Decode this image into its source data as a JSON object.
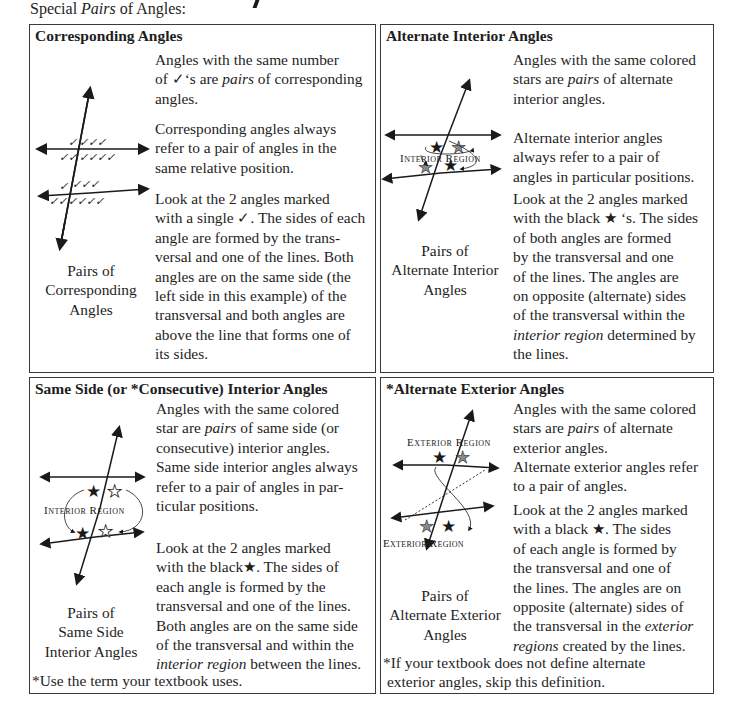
{
  "page": {
    "title_prefix": "Special ",
    "title_italic": "Pairs",
    "title_suffix": " of Angles:"
  },
  "cells": {
    "corresponding": {
      "title": "Corresponding Angles",
      "para1": [
        "Angles with the same number",
        "of ✓‘s are ",
        "pairs",
        " of corresponding",
        "angles."
      ],
      "para2": [
        "Corresponding angles always",
        "refer to a pair of angles in the",
        "same relative position."
      ],
      "para3": [
        "Look at the 2 angles marked",
        "with a single ✓. The sides of each",
        "angle are formed by the trans-",
        "versal and one of the lines. Both",
        "angles are on the same side (the",
        "left side in this example) of the",
        "transversal and both angles are",
        "above the line that forms one of",
        "its sides."
      ],
      "caption": [
        "Pairs of",
        "Corresponding",
        "Angles"
      ],
      "diagram_icon": "check-marks-diagram"
    },
    "alternate_interior": {
      "title": "Alternate Interior Angles",
      "para1": [
        "Angles with the same colored",
        "stars are ",
        "pairs",
        " of alternate",
        "interior angles."
      ],
      "para2": [
        "Alternate interior angles",
        "always refer to a pair of",
        "angles in particular positions."
      ],
      "para3": [
        "Look at the 2 angles marked",
        "with the black ★ ‘s. The sides",
        "of both angles are formed",
        "by the transversal and one",
        "of the lines. The angles are",
        "on opposite (alternate) sides",
        "of the transversal within the",
        "interior region",
        " determined by",
        "the lines."
      ],
      "caption": [
        "Pairs of",
        "Alternate Interior",
        "Angles"
      ],
      "region_label": "Interior Region"
    },
    "same_side_interior": {
      "title": "Same Side (or *Consecutive) Interior Angles",
      "para1": [
        "Angles with the same colored",
        "star are ",
        "pairs",
        " of same side (or",
        "consecutive) interior angles.",
        "Same side interior angles always",
        "refer to a pair of angles in par-",
        "ticular positions."
      ],
      "para2": [
        "Look at the 2 angles marked",
        "with the black★. The sides of",
        "each angle is formed by the",
        "transversal and one of the lines.",
        "Both angles are on the same side",
        "of the transversal and within the",
        "interior region",
        " between the lines."
      ],
      "caption": [
        "Pairs of",
        "Same Side",
        "Interior Angles"
      ],
      "region_label": "Interior Region",
      "footnote": "*Use the term your textbook uses."
    },
    "alternate_exterior": {
      "title": "*Alternate Exterior Angles",
      "para1": [
        "Angles with the same colored",
        "stars are ",
        "pairs",
        " of alternate",
        "exterior angles."
      ],
      "para2": [
        "Alternate exterior angles refer",
        "to a pair of angles."
      ],
      "para3": [
        "Look at the 2 angles marked",
        "with a black ★. The sides",
        "of each angle is formed by",
        "the transversal and one of",
        "the lines. The angles are on",
        "opposite (alternate) sides of",
        "the transversal in the ",
        "exterior",
        "regions",
        " created by the lines."
      ],
      "caption": [
        "Pairs of",
        "Alternate Exterior",
        "Angles"
      ],
      "region_label_top": "Exterior Region",
      "region_label_bottom": "Exterior Region",
      "footnote": [
        "*If your textbook does not define alternate",
        "exterior angles, skip this definition."
      ]
    }
  },
  "colors": {
    "border": "#3a3a3a",
    "text": "#1e1e1e",
    "star_black": "#1a1a1a",
    "star_gray": "#8a8a8a"
  }
}
